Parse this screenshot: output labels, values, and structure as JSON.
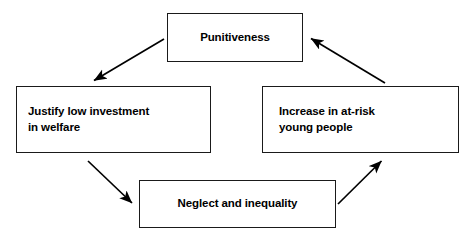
{
  "diagram": {
    "type": "cycle-diagram",
    "title": "",
    "canvas": {
      "width": 470,
      "height": 243
    },
    "colors": {
      "background": "#ffffff",
      "box_border": "#1a1a1a",
      "box_fill": "#ffffff",
      "text": "#000000",
      "arrow": "#000000"
    },
    "nodes": [
      {
        "id": "punitiveness",
        "label": "Punitiveness",
        "align": "center"
      },
      {
        "id": "justify_low_investment",
        "label": "Justify low investment\nin welfare",
        "align": "left"
      },
      {
        "id": "increase_at_risk",
        "label": "Increase in at-risk\nyoung people",
        "align": "left"
      },
      {
        "id": "neglect_inequality",
        "label": "Neglect and inequality",
        "align": "center"
      }
    ],
    "edges": [
      {
        "id": "edge-punitiveness-to-justify",
        "from": "punitiveness",
        "to": "justify_low_investment",
        "direction": "down-left",
        "x1": 164,
        "y1": 39,
        "x2": 92,
        "y2": 82
      },
      {
        "id": "edge-justify-to-neglect",
        "from": "justify_low_investment",
        "to": "neglect_inequality",
        "direction": "down-right",
        "x1": 88,
        "y1": 161,
        "x2": 134,
        "y2": 205
      },
      {
        "id": "edge-neglect-to-increase",
        "from": "neglect_inequality",
        "to": "increase_at_risk",
        "direction": "up-right",
        "x1": 338,
        "y1": 204,
        "x2": 383,
        "y2": 159
      },
      {
        "id": "edge-increase-to-punitiveness",
        "from": "increase_at_risk",
        "to": "punitiveness",
        "direction": "up-left",
        "x1": 385,
        "y1": 83,
        "x2": 309,
        "y2": 37
      }
    ]
  }
}
